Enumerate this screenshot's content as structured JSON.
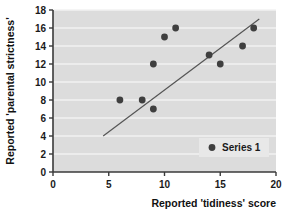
{
  "chart_data": {
    "type": "scatter",
    "title": "",
    "xlabel": "Reported 'tidiness' score",
    "ylabel": "Reported 'parental strictness'",
    "xlim": [
      0,
      20
    ],
    "ylim": [
      0,
      18
    ],
    "xticks": [
      0,
      5,
      10,
      15,
      20
    ],
    "yticks": [
      0,
      2,
      4,
      6,
      8,
      10,
      12,
      14,
      16,
      18
    ],
    "xtick_labels": [
      "0",
      "5",
      "10",
      "15",
      "20"
    ],
    "ytick_labels": [
      "0",
      "2",
      "4",
      "6",
      "8",
      "10",
      "12",
      "14",
      "16",
      "18"
    ],
    "grid": "horizontal",
    "legend": {
      "position": "bottom-right",
      "entries": [
        {
          "name": "Series 1",
          "marker": "circle",
          "color": "#3f3f3f"
        }
      ]
    },
    "series": [
      {
        "name": "Series 1",
        "marker": "circle",
        "color": "#3f3f3f",
        "points": [
          {
            "x": 6,
            "y": 8
          },
          {
            "x": 8,
            "y": 8
          },
          {
            "x": 9,
            "y": 7
          },
          {
            "x": 9,
            "y": 12
          },
          {
            "x": 10,
            "y": 15
          },
          {
            "x": 11,
            "y": 16
          },
          {
            "x": 14,
            "y": 13
          },
          {
            "x": 15,
            "y": 12
          },
          {
            "x": 17,
            "y": 14
          },
          {
            "x": 18,
            "y": 16
          }
        ]
      }
    ],
    "trendline": {
      "type": "line",
      "color": "#555555",
      "x0": 4.5,
      "y0": 4,
      "x1": 18.5,
      "y1": 17
    },
    "colors": {
      "plot_background": "#dcdcdc",
      "gridline": "#f2f2f2",
      "axis": "#3a3a3a",
      "marker": "#3f3f3f",
      "trendline": "#555555",
      "legend_background": "#e8e8e8",
      "text": "#111111"
    }
  }
}
